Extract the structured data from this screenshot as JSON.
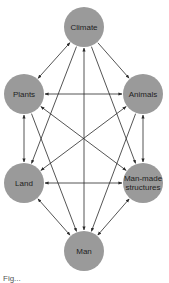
{
  "diagram": {
    "type": "network",
    "node_color": "#9a9a9a",
    "edge_color": "#2a2a2a",
    "nodes": [
      {
        "id": "climate",
        "label": "Climate",
        "cx": 84,
        "cy": 27,
        "r": 20
      },
      {
        "id": "plants",
        "label": "Plants",
        "cx": 24,
        "cy": 94,
        "r": 20
      },
      {
        "id": "animals",
        "label": "Animals",
        "cx": 143,
        "cy": 94,
        "r": 20
      },
      {
        "id": "land",
        "label": "Land",
        "cx": 24,
        "cy": 183,
        "r": 20
      },
      {
        "id": "manmade",
        "label": "Man-made structures",
        "cx": 143,
        "cy": 183,
        "r": 20
      },
      {
        "id": "man",
        "label": "Man",
        "cx": 84,
        "cy": 251,
        "r": 20
      }
    ],
    "edges": [
      {
        "from": "climate",
        "to": "plants",
        "bidirectional": true
      },
      {
        "from": "climate",
        "to": "animals",
        "bidirectional": false
      },
      {
        "from": "climate",
        "to": "land",
        "bidirectional": false
      },
      {
        "from": "climate",
        "to": "man",
        "bidirectional": true
      },
      {
        "from": "climate",
        "to": "manmade",
        "bidirectional": false
      },
      {
        "from": "plants",
        "to": "animals",
        "bidirectional": true
      },
      {
        "from": "plants",
        "to": "land",
        "bidirectional": true
      },
      {
        "from": "plants",
        "to": "manmade",
        "bidirectional": true
      },
      {
        "from": "animals",
        "to": "land",
        "bidirectional": true
      },
      {
        "from": "animals",
        "to": "manmade",
        "bidirectional": true
      },
      {
        "from": "land",
        "to": "manmade",
        "bidirectional": true
      },
      {
        "from": "land",
        "to": "man",
        "bidirectional": true
      },
      {
        "from": "manmade",
        "to": "man",
        "bidirectional": true
      },
      {
        "from": "plants",
        "to": "man",
        "bidirectional": false
      },
      {
        "from": "animals",
        "to": "man",
        "bidirectional": false
      }
    ]
  },
  "labels": {
    "climate": "Climate",
    "plants": "Plants",
    "animals": "Animals",
    "land": "Land",
    "manmade": "Man-made structures",
    "man": "Man"
  },
  "caption": "Fig..."
}
